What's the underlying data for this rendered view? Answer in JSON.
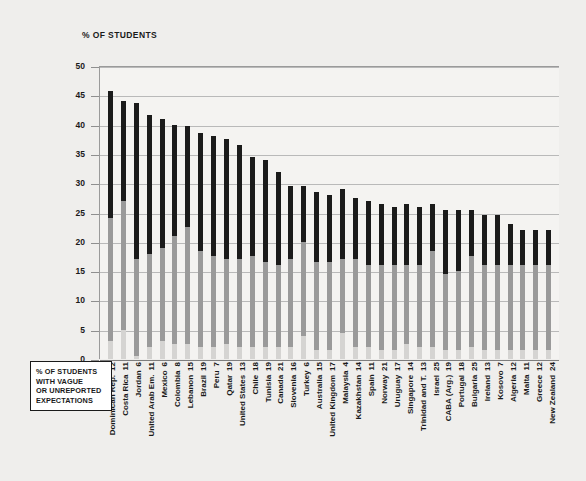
{
  "axis_title": "% OF STUDENTS",
  "legend": {
    "lines": [
      "% OF STUDENTS",
      "WITH VAGUE",
      "OR UNREPORTED",
      "EXPECTATIONS"
    ]
  },
  "colors": {
    "background": "#efeeec",
    "plot_background": "#f4f3f1",
    "dark_segment": "#1b1b1b",
    "mid_segment": "#9a9a9a",
    "light_segment": "#d5d4d2",
    "gridline": "#b9b9b9",
    "text": "#1a1a1a"
  },
  "chart_data": {
    "type": "bar",
    "title": "",
    "subtitle": "",
    "xlabel": "",
    "ylabel": "% OF STUDENTS",
    "ylim": [
      0,
      50
    ],
    "yticks": [
      0,
      5,
      10,
      15,
      20,
      25,
      30,
      35,
      40,
      45,
      50
    ],
    "grid": true,
    "stacked": true,
    "legend_position": "bottom-left",
    "bar_annotation_label": "% of students with vague or unreported expectations",
    "categories": [
      "Dominican Rep.",
      "Costa Rica",
      "Jordan",
      "United Arab Em.",
      "Mexico",
      "Colombia",
      "Lebanon",
      "Brazil",
      "Peru",
      "Qatar",
      "United States",
      "Chile",
      "Tunisia",
      "Canada",
      "Slovenia",
      "Turkey",
      "Australia",
      "United Kingdom",
      "Malaysia",
      "Kazakhstan",
      "Spain",
      "Norway",
      "Uruguay",
      "Singapore",
      "Trinidad and T.",
      "Israel",
      "CABA (Arg.)",
      "Portugal",
      "Bulgaria",
      "Ireland",
      "Kosovo",
      "Algeria",
      "Malta",
      "Greece",
      "New Zealand"
    ],
    "annotations": [
      12,
      11,
      6,
      11,
      6,
      8,
      15,
      19,
      7,
      19,
      13,
      18,
      19,
      21,
      16,
      6,
      15,
      17,
      4,
      14,
      11,
      21,
      17,
      14,
      13,
      25,
      19,
      18,
      25,
      13,
      7,
      12,
      11,
      12,
      24
    ],
    "series": [
      {
        "name": "light",
        "color": "#d5d4d2",
        "values": [
          3.0,
          5.0,
          0.5,
          2.0,
          3.0,
          2.5,
          2.5,
          2.0,
          2.0,
          2.5,
          2.0,
          2.0,
          2.0,
          2.0,
          2.0,
          4.0,
          1.5,
          1.5,
          4.5,
          2.0,
          2.0,
          1.5,
          1.5,
          2.5,
          2.0,
          2.0,
          1.5,
          1.5,
          2.0,
          1.5,
          1.5,
          1.5,
          1.5,
          1.5,
          1.5
        ]
      },
      {
        "name": "mid",
        "color": "#9a9a9a",
        "values": [
          21.0,
          22.0,
          16.5,
          16.0,
          16.0,
          18.5,
          20.0,
          16.5,
          15.5,
          14.5,
          15.0,
          15.5,
          14.5,
          14.0,
          15.0,
          16.0,
          15.0,
          15.0,
          12.5,
          15.0,
          14.0,
          14.5,
          14.5,
          13.5,
          14.0,
          16.5,
          13.0,
          13.5,
          15.5,
          14.5,
          14.5,
          14.5,
          14.5,
          14.5,
          14.5
        ]
      },
      {
        "name": "dark",
        "color": "#1b1b1b",
        "values": [
          21.8,
          17.0,
          26.7,
          23.7,
          22.0,
          19.0,
          17.3,
          20.0,
          20.5,
          20.5,
          19.5,
          17.0,
          17.5,
          16.0,
          12.5,
          9.5,
          12.0,
          11.5,
          12.0,
          10.5,
          11.0,
          10.5,
          10.0,
          10.5,
          10.0,
          8.0,
          11.0,
          10.5,
          8.0,
          8.5,
          8.5,
          7.0,
          6.0,
          6.0,
          6.0
        ]
      }
    ],
    "totals": [
      45.8,
      44.0,
      43.7,
      41.7,
      41.0,
      40.0,
      39.8,
      38.5,
      38.0,
      37.5,
      36.5,
      34.5,
      34.0,
      32.0,
      29.5,
      29.5,
      28.5,
      28.0,
      29.0,
      27.5,
      27.0,
      26.5,
      26.0,
      26.5,
      26.0,
      26.5,
      25.5,
      25.5,
      25.5,
      24.5,
      24.5,
      23.0,
      22.0,
      22.0,
      22.0
    ]
  }
}
